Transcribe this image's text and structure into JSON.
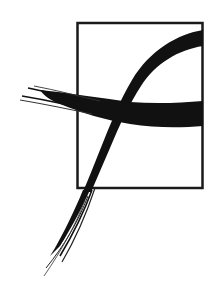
{
  "logo": {
    "description": "Brush-stroke letter f crossing a rectangular frame",
    "colors": {
      "background": "#ffffff",
      "ink": "#111111",
      "frame": "#1a1a1a"
    },
    "frame": {
      "x": 77,
      "y": 22,
      "width": 126,
      "height": 166,
      "stroke_width": 2.5
    }
  }
}
